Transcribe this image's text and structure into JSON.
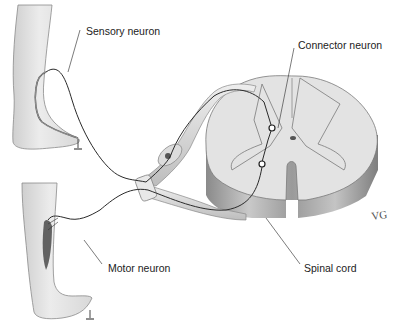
{
  "figure": {
    "labels": {
      "sensory_neuron": "Sensory neuron",
      "connector_neuron": "Connector neuron",
      "motor_neuron": "Motor neuron",
      "spinal_cord": "Spinal cord"
    },
    "signature": "VG",
    "colors": {
      "background": "#ffffff",
      "skin": "#e6e6e6",
      "cord_top": "#e2e2e2",
      "cord_side": "#9a9a9a",
      "nerve": "#d0d0d0",
      "line": "#333333",
      "muscle": "#555555"
    }
  }
}
